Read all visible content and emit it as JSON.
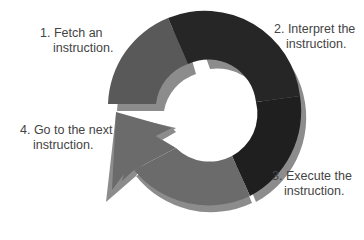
{
  "colors": {
    "fetch": "#595959",
    "interpret": "#262626",
    "execute": "#1f1f1f",
    "next": "#6b6b6b",
    "shadow": "#8c8c8c",
    "text": "#444444",
    "background": "#ffffff"
  },
  "steps": [
    {
      "line1": "1. Fetch an",
      "line2": "instruction."
    },
    {
      "line1": "2. Interpret the",
      "line2": "instruction."
    },
    {
      "line1": "3. Execute the",
      "line2": "instruction."
    },
    {
      "line1": "4. Go to the next",
      "line2": "instruction."
    }
  ]
}
